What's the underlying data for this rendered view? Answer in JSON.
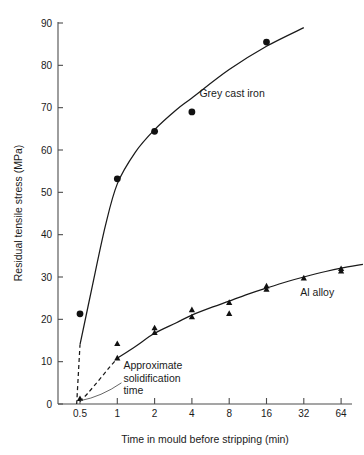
{
  "chart_data": {
    "type": "scatter",
    "title": "",
    "xlabel": "Time in mould before stripping (min)",
    "ylabel": "Residual tensile stress (MPa)",
    "xscale": "log2",
    "xticks": [
      "0.5",
      "1",
      "2",
      "4",
      "8",
      "16",
      "32",
      "64"
    ],
    "xtick_values": [
      0.5,
      1,
      2,
      4,
      8,
      16,
      32,
      64
    ],
    "yticks": [
      "0",
      "10",
      "20",
      "30",
      "40",
      "50",
      "60",
      "70",
      "80",
      "90"
    ],
    "ytick_values": [
      0,
      10,
      20,
      30,
      40,
      50,
      60,
      70,
      80,
      90
    ],
    "ylim": [
      0,
      92
    ],
    "xlim": [
      0.38,
      110
    ],
    "grid": false,
    "legend": "inline-labels",
    "series": [
      {
        "name": "Grey cast iron",
        "marker": "filled-circle",
        "label_x": 4.6,
        "label_y": 72.5,
        "points": [
          {
            "x": 0.5,
            "y": 21.3
          },
          {
            "x": 1.0,
            "y": 53.2
          },
          {
            "x": 2.0,
            "y": 64.4
          },
          {
            "x": 4.0,
            "y": 69.0
          },
          {
            "x": 16.0,
            "y": 85.5
          }
        ],
        "fit_solid": [
          {
            "x": 0.5,
            "y": 14.0
          },
          {
            "x": 0.62,
            "y": 27.0
          },
          {
            "x": 0.8,
            "y": 42.0
          },
          {
            "x": 1.0,
            "y": 52.0
          },
          {
            "x": 1.4,
            "y": 59.5
          },
          {
            "x": 2.0,
            "y": 64.8
          },
          {
            "x": 3.0,
            "y": 69.5
          },
          {
            "x": 4.0,
            "y": 72.3
          },
          {
            "x": 8.0,
            "y": 79.0
          },
          {
            "x": 16.0,
            "y": 84.5
          },
          {
            "x": 32.0,
            "y": 88.9
          }
        ],
        "fit_dashed": [
          {
            "x": 0.47,
            "y": 0.0
          },
          {
            "x": 0.5,
            "y": 14.0
          }
        ]
      },
      {
        "name": "Al alloy",
        "marker": "filled-triangle",
        "label_x": 30.0,
        "label_y": 25.5,
        "points": [
          {
            "x": 0.5,
            "y": 1.2
          },
          {
            "x": 1.0,
            "y": 10.8
          },
          {
            "x": 1.0,
            "y": 14.2
          },
          {
            "x": 2.0,
            "y": 16.8
          },
          {
            "x": 2.0,
            "y": 17.9
          },
          {
            "x": 4.0,
            "y": 20.5
          },
          {
            "x": 4.0,
            "y": 22.2
          },
          {
            "x": 8.0,
            "y": 21.3
          },
          {
            "x": 8.0,
            "y": 23.9
          },
          {
            "x": 16.0,
            "y": 27.0
          },
          {
            "x": 16.0,
            "y": 27.8
          },
          {
            "x": 32.0,
            "y": 29.7
          },
          {
            "x": 64.0,
            "y": 31.3
          },
          {
            "x": 64.0,
            "y": 31.9
          }
        ],
        "fit_solid": [
          {
            "x": 1.0,
            "y": 10.8
          },
          {
            "x": 1.4,
            "y": 13.6
          },
          {
            "x": 2.0,
            "y": 16.7
          },
          {
            "x": 3.0,
            "y": 19.2
          },
          {
            "x": 4.0,
            "y": 21.0
          },
          {
            "x": 6.0,
            "y": 23.0
          },
          {
            "x": 8.0,
            "y": 24.3
          },
          {
            "x": 12.0,
            "y": 26.2
          },
          {
            "x": 16.0,
            "y": 27.4
          },
          {
            "x": 24.0,
            "y": 29.0
          },
          {
            "x": 32.0,
            "y": 30.0
          },
          {
            "x": 48.0,
            "y": 31.3
          },
          {
            "x": 64.0,
            "y": 32.1
          },
          {
            "x": 96.0,
            "y": 33.0
          }
        ],
        "fit_dashed": [
          {
            "x": 0.5,
            "y": 0.6
          },
          {
            "x": 0.58,
            "y": 2.6
          },
          {
            "x": 0.7,
            "y": 5.4
          },
          {
            "x": 0.85,
            "y": 8.4
          },
          {
            "x": 1.0,
            "y": 10.8
          }
        ]
      }
    ],
    "annotations": [
      {
        "name": "approximate-solidification-time",
        "lines": [
          "Approximate",
          "solidification",
          "time"
        ],
        "text_x": 1.12,
        "text_y": 8.2,
        "leader_from_x": 1.08,
        "leader_from_y": 5.0,
        "leader_to_x": 0.505,
        "leader_to_y": 0.8
      }
    ]
  }
}
